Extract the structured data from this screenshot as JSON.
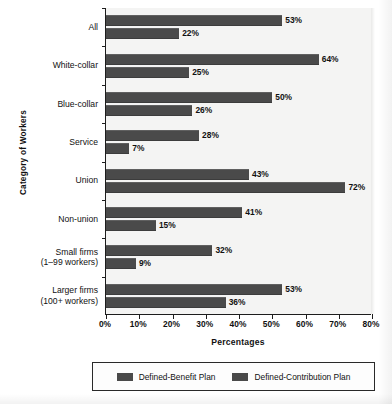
{
  "chart_data": {
    "type": "bar",
    "orientation": "horizontal",
    "title": "",
    "xlabel": "Percentages",
    "ylabel": "Category of Workers",
    "xlim": [
      0,
      80
    ],
    "xticks": [
      "0%",
      "10%",
      "20%",
      "30%",
      "40%",
      "50%",
      "60%",
      "70%",
      "80%"
    ],
    "xtick_values": [
      0,
      10,
      20,
      30,
      40,
      50,
      60,
      70,
      80
    ],
    "grid": false,
    "legend_position": "bottom",
    "categories": [
      "All",
      "White-collar",
      "Blue-collar",
      "Service",
      "Union",
      "Non-union",
      "Small firms\n(1–99 workers)",
      "Larger firms\n(100+ workers)"
    ],
    "category_lines": [
      [
        "All"
      ],
      [
        "White-collar"
      ],
      [
        "Blue-collar"
      ],
      [
        "Service"
      ],
      [
        "Union"
      ],
      [
        "Non-union"
      ],
      [
        "Small firms",
        "(1–99 workers)"
      ],
      [
        "Larger firms",
        "(100+ workers)"
      ]
    ],
    "series": [
      {
        "name": "Defined-Benefit Plan",
        "color": "#4a4a4a",
        "values": [
          53,
          64,
          50,
          28,
          43,
          41,
          32,
          53
        ],
        "labels": [
          "53%",
          "64%",
          "50%",
          "28%",
          "43%",
          "41%",
          "32%",
          "53%"
        ]
      },
      {
        "name": "Defined-Contribution Plan",
        "color": "#4a4a4a",
        "values": [
          22,
          25,
          26,
          7,
          72,
          15,
          9,
          36
        ],
        "labels": [
          "22%",
          "25%",
          "26%",
          "7%",
          "72%",
          "15%",
          "9%",
          "36%"
        ]
      }
    ]
  },
  "legend": {
    "items": [
      {
        "label": "Defined-Benefit Plan",
        "color": "#4a4a4a"
      },
      {
        "label": "Defined-Contribution Plan",
        "color": "#4a4a4a"
      }
    ]
  },
  "style": {
    "plot_background": "#f4f4f3",
    "page_background": "#ffffff",
    "axis_color": "#1d1d1d",
    "bar_color": "#4a4a4a",
    "text_color": "#111111"
  }
}
